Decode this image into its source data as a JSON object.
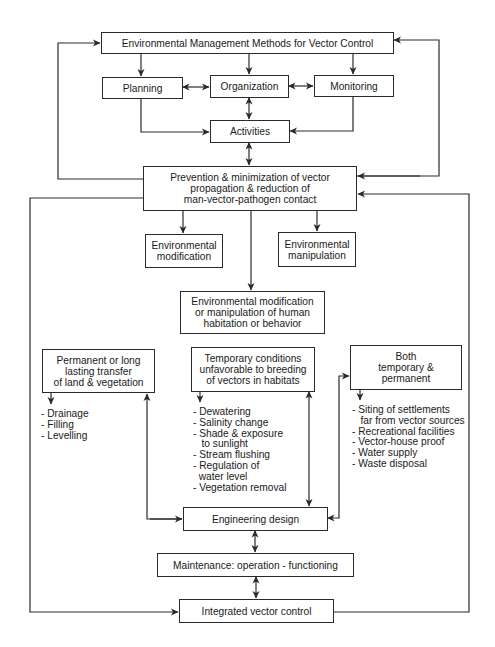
{
  "diagram": {
    "top": {
      "label": "Environmental Management Methods for Vector Control"
    },
    "planning": {
      "label": "Planning"
    },
    "organization": {
      "label": "Organization"
    },
    "monitoring": {
      "label": "Monitoring"
    },
    "activities": {
      "label": "Activities"
    },
    "prevention": {
      "label": "Prevention & minimization of vector\npropagation & reduction of\nman-vector-pathogen contact"
    },
    "env_modification": {
      "label": "Environmental\nmodification"
    },
    "env_manipulation": {
      "label": "Environmental\nmanipulation"
    },
    "human_habitation": {
      "label": "Environmental modification\nor manipulation of human\nhabitation or behavior"
    },
    "permanent": {
      "label": "Permanent or long\nlasting transfer\nof land & vegetation",
      "items": [
        "- Drainage",
        "- Filling",
        "- Levelling"
      ]
    },
    "temporary": {
      "label": "Temporary conditions\nunfavorable to breeding\nof vectors in habitats",
      "items": [
        "- Dewatering",
        "- Salinity change",
        "- Shade & exposure",
        "   to sunlight",
        "- Stream flushing",
        "- Regulation of",
        "  water level",
        "- Vegetation removal"
      ]
    },
    "both": {
      "label": "Both\ntemporary &\npermanent",
      "items": [
        "- Siting of settlements",
        "   far from vector sources",
        "- Recreational facilities",
        "- Vector-house proof",
        "- Water supply",
        "- Waste disposal"
      ]
    },
    "engineering": {
      "label": "Engineering design"
    },
    "maintenance": {
      "label": "Maintenance: operation - functioning"
    },
    "integrated": {
      "label": "Integrated vector control"
    }
  },
  "caption": "...methods for vector control (caption cut off)"
}
